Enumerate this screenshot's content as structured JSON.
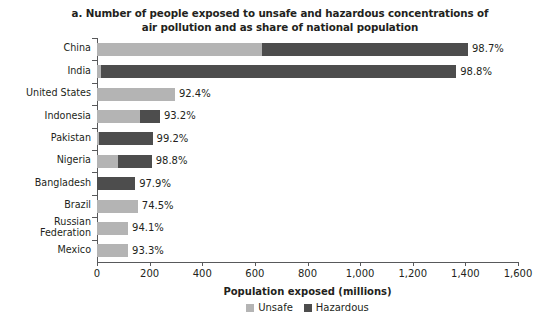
{
  "chart_data": {
    "type": "bar",
    "orientation": "horizontal",
    "stacked": true,
    "title": "a. Number of people exposed to unsafe and hazardous concentrations of air pollution and as share of national population",
    "xlabel": "Population exposed (millions)",
    "ylabel": "",
    "xlim": [
      0,
      1600
    ],
    "xticks": [
      0,
      200,
      400,
      600,
      800,
      1000,
      1200,
      1400,
      1600
    ],
    "xtick_labels": [
      "0",
      "200",
      "400",
      "600",
      "800",
      "1,000",
      "1,200",
      "1,400",
      "1,600"
    ],
    "grid": false,
    "legend_position": "bottom",
    "legend": [
      "Unsafe",
      "Hazardous"
    ],
    "colors": {
      "unsafe": "#b4b4b4",
      "hazardous": "#4d4d4d",
      "text": "#231f20",
      "axis": "#58595b"
    },
    "categories": [
      "China",
      "India",
      "United States",
      "Indonesia",
      "Pakistan",
      "Nigeria",
      "Bangladesh",
      "Brazil",
      "Russian\nFederation",
      "Mexico"
    ],
    "series": [
      {
        "name": "Unsafe",
        "values": [
          627,
          14,
          296,
          163,
          8,
          78,
          0,
          155,
          118,
          118
        ]
      },
      {
        "name": "Hazardous",
        "values": [
          783,
          1351,
          0,
          76,
          203,
          130,
          145,
          0,
          0,
          0
        ]
      }
    ],
    "totals": [
      1410,
      1365,
      296,
      239,
      211,
      208,
      145,
      155,
      118,
      118
    ],
    "data_labels": [
      "98.7%",
      "98.8%",
      "92.4%",
      "93.2%",
      "99.2%",
      "98.8%",
      "97.9%",
      "74.5%",
      "94.1%",
      "93.3%"
    ],
    "data_label_note": "share of national population exposed"
  }
}
